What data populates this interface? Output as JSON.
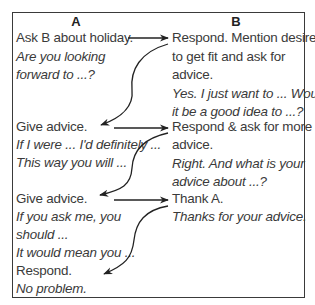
{
  "diagram": {
    "columns": [
      {
        "id": "A",
        "header": "A"
      },
      {
        "id": "B",
        "header": "B"
      }
    ],
    "steps": [
      {
        "column": "A",
        "instruction": "Ask B about holiday.",
        "phrases": [
          "Are you looking",
          "forward to ...?"
        ]
      },
      {
        "column": "B",
        "instruction_lines": [
          "Respond. Mention desire",
          "to get fit and ask for",
          "advice."
        ],
        "phrases": [
          "Yes. I just want to ... Would",
          "it be a good idea to ...?"
        ]
      },
      {
        "column": "A",
        "instruction": "Give advice.",
        "phrases": [
          "If I were ... I'd definitely ...",
          "This way you will ..."
        ]
      },
      {
        "column": "B",
        "instruction_lines": [
          "Respond & ask for more",
          "advice."
        ],
        "phrases": [
          "Right. And what is your",
          "advice about ...?"
        ]
      },
      {
        "column": "A",
        "instruction": "Give advice.",
        "phrases": [
          "If you ask me, you",
          "should ...",
          "It would mean you ..."
        ]
      },
      {
        "column": "B",
        "instruction": "Thank A.",
        "phrases": [
          "Thanks for your advice."
        ]
      },
      {
        "column": "A",
        "instruction": "Respond.",
        "phrases": [
          "No problem."
        ]
      }
    ],
    "arrows": [
      {
        "from": "A1",
        "to": "B1",
        "type": "straight"
      },
      {
        "from": "B1",
        "to": "A2",
        "type": "curved"
      },
      {
        "from": "A2",
        "to": "B2",
        "type": "straight"
      },
      {
        "from": "B2",
        "to": "A3",
        "type": "curved"
      },
      {
        "from": "A3",
        "to": "B3",
        "type": "straight"
      },
      {
        "from": "B3",
        "to": "A4",
        "type": "curved"
      }
    ],
    "colors": {
      "text": "#3a3a3a",
      "border": "#3a3a3a",
      "arrow": "#222222"
    }
  }
}
